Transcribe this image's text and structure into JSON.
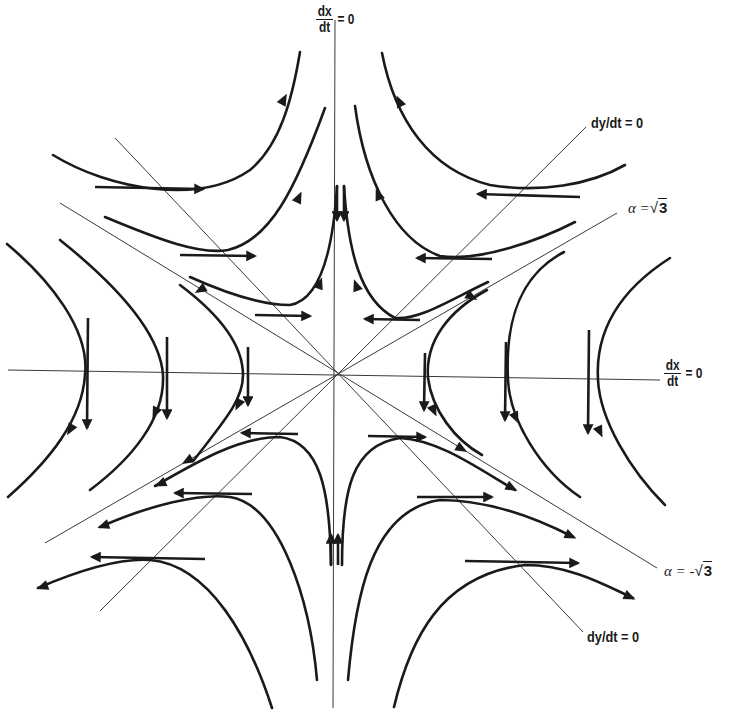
{
  "diagram": {
    "type": "phase-portrait",
    "center": [
      338,
      375
    ],
    "colors": {
      "ink": "#1a1a1a",
      "guide": "#3a3a3a",
      "background": "#ffffff"
    }
  },
  "labels": {
    "dxdt_top": {
      "num": "dx",
      "den": "dt",
      "rhs": "= 0"
    },
    "dxdt_right": {
      "num": "dx",
      "den": "dt",
      "rhs": "= 0"
    },
    "dydt_top": "dy/dt  =  0",
    "dydt_bottom": "dy/dt  =  0",
    "alpha_pos": {
      "lhs": "α =",
      "radical": "√",
      "value": "3"
    },
    "alpha_neg": {
      "lhs": "α = -",
      "radical": "√",
      "value": "3"
    }
  },
  "guide_lines": [
    {
      "name": "vertical-axis-dxdt-zero",
      "d": "M335 20 L333 708"
    },
    {
      "name": "horizontal-axis-dxdt-zero",
      "d": "M8 370 L660 380"
    },
    {
      "name": "dydt-zero-line-ne",
      "d": "M586 127 L100 611"
    },
    {
      "name": "dydt-zero-line-se",
      "d": "M115 138 L583 632"
    },
    {
      "name": "alpha-sqrt3-line",
      "d": "M617 213 L45 543"
    },
    {
      "name": "alpha-neg-sqrt3-line",
      "d": "M60 203 L657 568"
    }
  ],
  "trajectories": [
    {
      "name": "top-left-outer",
      "d": "M53 155 C110 190 200 205 250 170 C280 145 292 100 300 52"
    },
    {
      "name": "top-left-middle",
      "d": "M105 217 C160 240 200 255 228 250 C270 240 295 190 325 108"
    },
    {
      "name": "top-left-inner",
      "d": "M190 277 C230 295 265 305 290 305 C320 300 333 250 337 186"
    },
    {
      "name": "top-right-outer",
      "d": "M382 53 C395 120 430 170 490 185 C540 193 590 185 625 165"
    },
    {
      "name": "top-right-middle",
      "d": "M355 106 C365 180 395 240 440 256 C480 262 540 240 575 222"
    },
    {
      "name": "top-right-inner",
      "d": "M344 186 C348 250 360 300 395 318 C420 320 450 300 488 282"
    },
    {
      "name": "left-outer",
      "d": "M7 244 C50 280 90 330 85 375 C82 420 50 460 8 497"
    },
    {
      "name": "left-middle",
      "d": "M60 240 C110 280 160 330 163 375 C165 420 130 460 90 490"
    },
    {
      "name": "left-inner",
      "d": "M180 285 C220 315 243 345 243 375 C243 400 225 420 194 460"
    },
    {
      "name": "right-inner",
      "d": "M487 290 C450 310 425 340 428 378 C432 410 455 440 482 455"
    },
    {
      "name": "right-middle",
      "d": "M564 252 C520 275 505 320 508 380 C510 420 540 470 580 497"
    },
    {
      "name": "right-outer",
      "d": "M670 258 C620 290 595 330 598 380 C600 420 630 470 665 505"
    },
    {
      "name": "bottom-left-inner",
      "d": "M155 486 C200 460 240 437 280 437 C320 442 330 490 331 565"
    },
    {
      "name": "bottom-left-middle",
      "d": "M100 527 C150 505 200 493 230 497 C280 505 310 600 317 680"
    },
    {
      "name": "bottom-left-outer",
      "d": "M38 588 C80 570 120 558 150 560 C210 565 250 640 272 708"
    },
    {
      "name": "bottom-right-inner",
      "d": "M342 565 C342 490 352 445 400 438 C440 440 480 470 515 490"
    },
    {
      "name": "bottom-right-middle",
      "d": "M348 680 C355 600 370 510 440 500 C490 500 540 520 573 537"
    },
    {
      "name": "bottom-right-outer",
      "d": "M394 707 C410 640 440 575 525 565 C570 565 605 585 633 598"
    }
  ],
  "vectors": [
    {
      "name": "vec-tl-outer",
      "x1": 95,
      "y1": 187,
      "x2": 203,
      "y2": 189
    },
    {
      "name": "vec-tl-middle",
      "x1": 180,
      "y1": 255,
      "x2": 255,
      "y2": 256
    },
    {
      "name": "vec-tl-inner",
      "x1": 255,
      "y1": 315,
      "x2": 310,
      "y2": 316
    },
    {
      "name": "vec-tr-outer",
      "x1": 580,
      "y1": 197,
      "x2": 478,
      "y2": 194
    },
    {
      "name": "vec-tr-middle",
      "x1": 492,
      "y1": 259,
      "x2": 417,
      "y2": 258
    },
    {
      "name": "vec-tr-inner",
      "x1": 420,
      "y1": 320,
      "x2": 365,
      "y2": 319
    },
    {
      "name": "vec-l-outer",
      "x1": 88,
      "y1": 318,
      "x2": 87,
      "y2": 428
    },
    {
      "name": "vec-l-middle",
      "x1": 167,
      "y1": 337,
      "x2": 167,
      "y2": 418
    },
    {
      "name": "vec-l-inner",
      "x1": 248,
      "y1": 347,
      "x2": 248,
      "y2": 405
    },
    {
      "name": "vec-r-inner",
      "x1": 425,
      "y1": 353,
      "x2": 424,
      "y2": 410
    },
    {
      "name": "vec-r-middle",
      "x1": 506,
      "y1": 342,
      "x2": 505,
      "y2": 420
    },
    {
      "name": "vec-r-outer",
      "x1": 589,
      "y1": 330,
      "x2": 588,
      "y2": 433
    },
    {
      "name": "vec-bl-inner",
      "x1": 298,
      "y1": 434,
      "x2": 242,
      "y2": 433
    },
    {
      "name": "vec-bl-middle",
      "x1": 252,
      "y1": 494,
      "x2": 175,
      "y2": 493
    },
    {
      "name": "vec-bl-outer",
      "x1": 205,
      "y1": 559,
      "x2": 92,
      "y2": 557
    },
    {
      "name": "vec-br-inner",
      "x1": 368,
      "y1": 436,
      "x2": 425,
      "y2": 437
    },
    {
      "name": "vec-br-middle",
      "x1": 417,
      "y1": 497,
      "x2": 492,
      "y2": 497
    },
    {
      "name": "vec-br-outer",
      "x1": 465,
      "y1": 561,
      "x2": 578,
      "y2": 563
    },
    {
      "name": "vec-top-center-left",
      "x1": 337,
      "y1": 186,
      "x2": 337,
      "y2": 220
    },
    {
      "name": "vec-top-center-right",
      "x1": 344,
      "y1": 186,
      "x2": 344,
      "y2": 220
    },
    {
      "name": "vec-bottom-center-left",
      "x1": 331,
      "y1": 565,
      "x2": 331,
      "y2": 535
    },
    {
      "name": "vec-bottom-center-right",
      "x1": 338,
      "y1": 565,
      "x2": 338,
      "y2": 535
    }
  ],
  "arrowheads": [
    {
      "name": "arrow-tl-outer-curve",
      "x": 284,
      "y": 99,
      "angle": -62
    },
    {
      "name": "arrow-tl-middle-curve",
      "x": 299,
      "y": 197,
      "angle": -65
    },
    {
      "name": "arrow-tl-inner-curve",
      "x": 320,
      "y": 283,
      "angle": -70
    },
    {
      "name": "arrow-tr-outer-curve",
      "x": 399,
      "y": 101,
      "angle": -115
    },
    {
      "name": "arrow-tr-middle-curve",
      "x": 378,
      "y": 194,
      "angle": -112
    },
    {
      "name": "arrow-tr-inner-curve",
      "x": 356,
      "y": 285,
      "angle": -110
    },
    {
      "name": "arrow-top-left-arm",
      "x": 200,
      "y": 290,
      "angle": 150
    },
    {
      "name": "arrow-top-right-arm",
      "x": 472,
      "y": 297,
      "angle": 30
    },
    {
      "name": "arrow-l-outer-curve",
      "x": 70,
      "y": 430,
      "angle": 120
    },
    {
      "name": "arrow-l-middle-curve",
      "x": 155,
      "y": 413,
      "angle": 115
    },
    {
      "name": "arrow-l-inner-curve",
      "x": 238,
      "y": 405,
      "angle": 115
    },
    {
      "name": "arrow-r-inner-curve",
      "x": 434,
      "y": 411,
      "angle": 65
    },
    {
      "name": "arrow-r-middle-curve",
      "x": 516,
      "y": 418,
      "angle": 65
    },
    {
      "name": "arrow-r-outer-curve",
      "x": 600,
      "y": 432,
      "angle": 65
    },
    {
      "name": "arrow-bl-arm-inner",
      "x": 187,
      "y": 461,
      "angle": 150
    },
    {
      "name": "arrow-bl-inner-curve",
      "x": 160,
      "y": 484,
      "angle": 155
    },
    {
      "name": "arrow-bl-middle-curve",
      "x": 103,
      "y": 526,
      "angle": 160
    },
    {
      "name": "arrow-bl-outer-curve",
      "x": 42,
      "y": 587,
      "angle": 160
    },
    {
      "name": "arrow-br-arm-inner",
      "x": 462,
      "y": 449,
      "angle": 30
    },
    {
      "name": "arrow-br-inner-curve",
      "x": 512,
      "y": 488,
      "angle": 28
    },
    {
      "name": "arrow-br-middle-curve",
      "x": 571,
      "y": 536,
      "angle": 25
    },
    {
      "name": "arrow-br-outer-curve",
      "x": 630,
      "y": 597,
      "angle": 25
    }
  ]
}
